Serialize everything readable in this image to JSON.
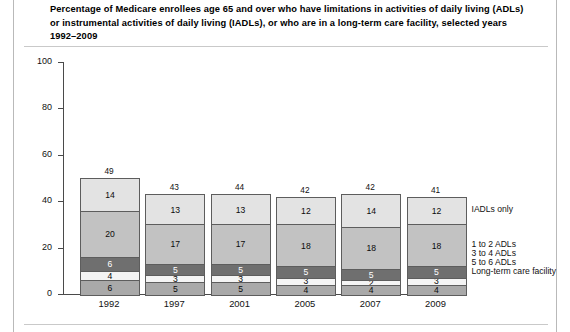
{
  "title": "Percentage of Medicare enrollees age 65 and over who have limitations in activities of daily living (ADLs) or instrumental activities of daily living (IADLs), or who are in a long-term care facility, selected years 1992–2009",
  "chart_data": {
    "type": "bar",
    "subtype": "stacked-vertical",
    "title": "Percentage of Medicare enrollees age 65 and over who have limitations in activities of daily living (ADLs) or instrumental activities of daily living (IADLs), or who are in a long-term care facility, selected years 1992–2009",
    "xlabel": "",
    "ylabel": "Percent",
    "ylim": [
      0,
      100
    ],
    "yticks": [
      0,
      20,
      40,
      60,
      80,
      100
    ],
    "grid": false,
    "legend_position": "right",
    "categories": [
      "1992",
      "1997",
      "2001",
      "2005",
      "2007",
      "2009"
    ],
    "totals": [
      49,
      43,
      44,
      42,
      42,
      41
    ],
    "series": [
      {
        "name": "Long-term care facility",
        "color": "#a9a9a9",
        "values": [
          6,
          5,
          5,
          4,
          4,
          4
        ]
      },
      {
        "name": "5 to 6 ADLs",
        "color": "#f4f4f4",
        "values": [
          4,
          3,
          3,
          3,
          2,
          3
        ]
      },
      {
        "name": "3 to 4 ADLs",
        "color": "#6f6f6f",
        "values": [
          6,
          5,
          5,
          5,
          5,
          5
        ]
      },
      {
        "name": "1 to 2 ADLs",
        "color": "#c2c2c2",
        "values": [
          20,
          17,
          17,
          18,
          18,
          18
        ]
      },
      {
        "name": "IADLs only",
        "color": "#e3e3e3",
        "values": [
          14,
          13,
          13,
          12,
          14,
          12
        ]
      }
    ],
    "legend_entries": [
      "IADLs only",
      "1 to 2 ADLs",
      "3 to 4 ADLs",
      "5 to 6 ADLs",
      "Long-term care facility"
    ]
  }
}
